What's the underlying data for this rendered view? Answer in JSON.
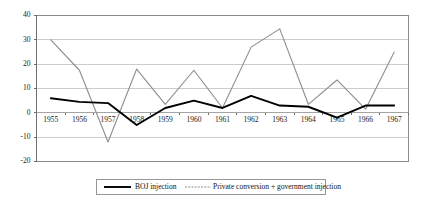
{
  "chart_data": {
    "type": "line",
    "title": "",
    "xlabel": "",
    "ylabel": "",
    "ylim": [
      -20,
      40
    ],
    "yticks": [
      40,
      30,
      20,
      10,
      0,
      -10,
      -20
    ],
    "grid": true,
    "legend_position": "bottom",
    "categories": [
      "1955",
      "1956",
      "1957",
      "1958",
      "1959",
      "1960",
      "1961",
      "1962",
      "1963",
      "1964",
      "1965",
      "1966",
      "1967"
    ],
    "series": [
      {
        "name": "BOJ injection",
        "style": "solid-black",
        "values": [
          6,
          4.5,
          4,
          -5,
          2,
          5,
          2,
          7,
          3,
          2.5,
          -2,
          3,
          3
        ]
      },
      {
        "name": "Private conversion + government injection",
        "style": "thin-gray",
        "values": [
          30,
          17.5,
          -12,
          18,
          3.5,
          17.5,
          2,
          27,
          34.5,
          3.5,
          13.5,
          1.5,
          25
        ]
      }
    ]
  },
  "axis": {
    "y_tick_labels": [
      "40",
      "30",
      "20",
      "10",
      "0",
      "-10",
      "-20"
    ],
    "x_tick_labels": [
      "1955",
      "1956",
      "1957",
      "1958",
      "1959",
      "1960",
      "1961",
      "1962",
      "1963",
      "1964",
      "1965",
      "1966",
      "1967"
    ]
  },
  "legend": {
    "entries": [
      {
        "label": "BOJ injection"
      },
      {
        "label": "Private conversion + government injection"
      }
    ]
  },
  "colors": {
    "series_boj": "#000000",
    "series_private": "#8d8d8d",
    "gridline": "#b6b6b6",
    "frame": "#8a8a8a",
    "background": "#ffffff"
  }
}
